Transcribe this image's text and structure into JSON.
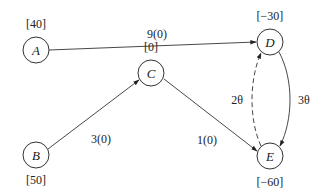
{
  "diagram": {
    "type": "network-flow",
    "nodes": [
      {
        "id": "A",
        "label": "A",
        "supply": "[40]",
        "cx": 36,
        "cy": 50
      },
      {
        "id": "D",
        "label": "D",
        "supply": "[−30]",
        "cx": 270,
        "cy": 42
      },
      {
        "id": "C",
        "label": "C",
        "supply": "[0]",
        "cx": 151,
        "cy": 73
      },
      {
        "id": "B",
        "label": "B",
        "supply": "[50]",
        "cx": 36,
        "cy": 155
      },
      {
        "id": "E",
        "label": "E",
        "supply": "[−60]",
        "cx": 270,
        "cy": 156
      }
    ],
    "edges": [
      {
        "from": "A",
        "to": "D",
        "label": "9(0)",
        "style": "solid"
      },
      {
        "from": "B",
        "to": "C",
        "label": "3(0)",
        "style": "solid"
      },
      {
        "from": "C",
        "to": "E",
        "label": "1(0)",
        "style": "solid"
      },
      {
        "from": "D",
        "to": "E",
        "label": "3θ",
        "style": "solid-curved"
      },
      {
        "from": "E",
        "to": "D",
        "label": "2θ",
        "style": "dashed-curved"
      }
    ]
  }
}
